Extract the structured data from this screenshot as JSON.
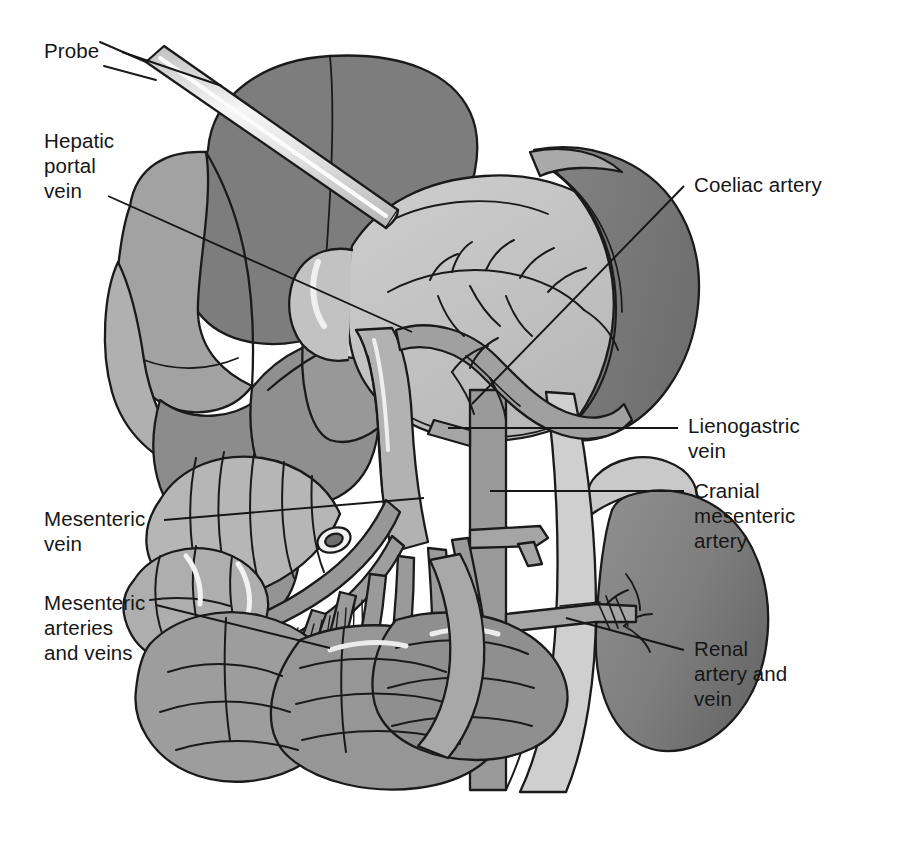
{
  "figure": {
    "background_color": "#ffffff",
    "line_color": "#161616",
    "width": 912,
    "height": 848
  },
  "palette": {
    "liver_dark": "#7d7d7d",
    "liver_mid": "#8f8f8f",
    "liver_light": "#a8a8a8",
    "stomach": "#c4c4c4",
    "stomach_shadow": "#b0b0b0",
    "spleen": "#7a7a7a",
    "kidney": "#808080",
    "adrenal": "#c9c9c9",
    "intestine_light": "#b6b6b6",
    "intestine_mid": "#9d9d9d",
    "vessel": "#9a9a9a",
    "vessel_light": "#bdbdbd",
    "probe": "#d8d8d8",
    "highlight": "#f2f2f2",
    "outline": "#1a1a1a"
  },
  "labels": [
    {
      "id": "probe",
      "text": "Probe",
      "side": "left",
      "x": 44,
      "y": 38,
      "leader": {
        "x1": 122,
        "y1": 52,
        "x2": 222,
        "y2": 86
      }
    },
    {
      "id": "hepatic-portal-vein",
      "text": "Hepatic\nportal\nvein",
      "side": "left",
      "x": 44,
      "y": 128,
      "leader": {
        "x1": 108,
        "y1": 196,
        "x2": 412,
        "y2": 332
      }
    },
    {
      "id": "mesenteric-vein",
      "text": "Mesenteric\nvein",
      "side": "left",
      "x": 44,
      "y": 506,
      "leader": {
        "x1": 164,
        "y1": 520,
        "x2": 424,
        "y2": 498
      }
    },
    {
      "id": "mesenteric-arteries-and-veins",
      "text": "Mesenteric\narteries\nand veins",
      "side": "left",
      "x": 44,
      "y": 590,
      "leader": {
        "x1": 156,
        "y1": 605,
        "x2": 330,
        "y2": 648
      }
    },
    {
      "id": "coeliac-artery",
      "text": "Coeliac artery",
      "side": "right",
      "x": 694,
      "y": 172,
      "leader": {
        "x1": 684,
        "y1": 186,
        "x2": 472,
        "y2": 404
      }
    },
    {
      "id": "lienogastric-vein",
      "text": "Lienogastric\nvein",
      "side": "right",
      "x": 688,
      "y": 413,
      "leader": {
        "x1": 678,
        "y1": 428,
        "x2": 448,
        "y2": 428
      }
    },
    {
      "id": "cranial-mesenteric-artery",
      "text": "Cranial\nmesenteric\nartery",
      "side": "right",
      "x": 694,
      "y": 478,
      "leader": {
        "x1": 684,
        "y1": 491,
        "x2": 490,
        "y2": 491
      }
    },
    {
      "id": "renal-artery-and-vein",
      "text": "Renal\nartery and\nvein",
      "side": "right",
      "x": 694,
      "y": 636,
      "leader": {
        "x1": 684,
        "y1": 650,
        "x2": 566,
        "y2": 618
      }
    }
  ],
  "structures": [
    {
      "id": "liver",
      "name": "liver"
    },
    {
      "id": "gallbladder",
      "name": "gallbladder"
    },
    {
      "id": "stomach",
      "name": "stomach"
    },
    {
      "id": "spleen",
      "name": "spleen"
    },
    {
      "id": "kidney",
      "name": "kidney"
    },
    {
      "id": "adrenal-gland",
      "name": "adrenal-gland"
    },
    {
      "id": "small-intestine",
      "name": "small-intestine"
    },
    {
      "id": "large-intestine",
      "name": "large-intestine"
    },
    {
      "id": "mesentery",
      "name": "mesentery"
    },
    {
      "id": "aorta",
      "name": "aorta"
    },
    {
      "id": "caudal-vena-cava",
      "name": "caudal-vena-cava"
    },
    {
      "id": "portal-vein",
      "name": "portal-vein"
    },
    {
      "id": "probe-rod",
      "name": "probe-rod"
    }
  ]
}
